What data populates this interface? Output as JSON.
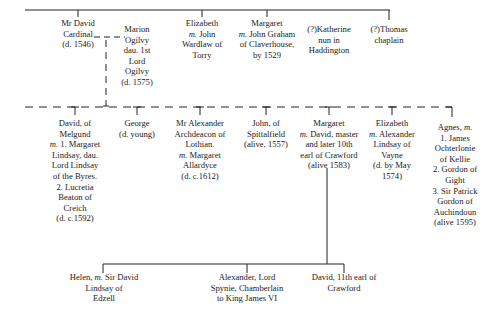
{
  "colors": {
    "line": "#222222",
    "text": "#1a1a1a",
    "background": "#ffffff"
  },
  "generation_1": [
    {
      "id": "david-cardinal",
      "lines": [
        "Mr David",
        "Cardinal",
        "(d. 1546)"
      ],
      "x": 78,
      "y": 18,
      "w": 70
    },
    {
      "id": "marion-ogilvy",
      "lines": [
        "Marion",
        "Ogilvy",
        "dau. 1st",
        "Lord",
        "Ogilvy",
        "(d. 1575)"
      ],
      "x": 137,
      "y": 24,
      "w": 60
    },
    {
      "id": "elizabeth-wardlaw",
      "lines": [
        "Elizabeth",
        "m. John",
        "Wardlaw of",
        "Torry"
      ],
      "x": 202,
      "y": 18,
      "w": 70
    },
    {
      "id": "margaret-graham",
      "lines": [
        "Margaret",
        "m. John Graham",
        "of Claverhouse,",
        "by 1529"
      ],
      "x": 267,
      "y": 18,
      "w": 76
    },
    {
      "id": "katherine",
      "lines": [
        "(?)Katherine",
        "nun in",
        "Haddington"
      ],
      "x": 329,
      "y": 24,
      "w": 66
    },
    {
      "id": "thomas",
      "lines": [
        "(?)Thomas",
        "chaplain"
      ],
      "x": 389,
      "y": 24,
      "w": 60
    }
  ],
  "generation_2": [
    {
      "id": "david-melgund",
      "lines": [
        "David, of",
        "Melgund",
        "m. 1. Margaret",
        "Lindsay, dau.",
        "Lord Lindsay",
        "of the Byres.",
        "2. Lucretia",
        "Beaton of",
        "Creich",
        "(d. c.1592)"
      ],
      "x": 75,
      "y": 118,
      "w": 72
    },
    {
      "id": "george",
      "lines": [
        "George",
        "(d. young)"
      ],
      "x": 137,
      "y": 118,
      "w": 60
    },
    {
      "id": "alexander-archdeacon",
      "lines": [
        "Mr Alexander",
        "Archdeacon of",
        "Lothian.",
        "m. Margaret",
        "Allardyce",
        "(d. c.1612)"
      ],
      "x": 200,
      "y": 118,
      "w": 70
    },
    {
      "id": "john-spittalfield",
      "lines": [
        "John, of",
        "Spittalfield",
        "(alive, 1557)"
      ],
      "x": 266,
      "y": 118,
      "w": 64
    },
    {
      "id": "margaret-crawford",
      "lines": [
        "Margaret",
        "m. David, master",
        "and later 10th",
        "earl of Crawford",
        "(alive 1583)"
      ],
      "x": 329,
      "y": 118,
      "w": 78
    },
    {
      "id": "elizabeth-lindsay",
      "lines": [
        "Elizabeth",
        "m. Alexander",
        "Lindsay of",
        "Vayne",
        "(d. by May",
        "1574)"
      ],
      "x": 392,
      "y": 118,
      "w": 66
    },
    {
      "id": "agnes",
      "lines": [
        "Agnes, m.",
        "1. James",
        "Ochterlonie",
        "of Kellie",
        "2. Gordon of",
        "Gight",
        "3. Sir Patrick",
        "Gordon of",
        "Auchindoun",
        "(alive 1595)"
      ],
      "x": 455,
      "y": 122,
      "w": 64
    }
  ],
  "generation_3": [
    {
      "id": "helen",
      "lines": [
        "Helen, m. Sir David",
        "Lindsay of",
        "Edzell"
      ],
      "x": 104,
      "y": 272,
      "w": 90
    },
    {
      "id": "alexander-spynie",
      "lines": [
        "Alexander, Lord",
        "Spynie, Chamberlain",
        "to King James VI"
      ],
      "x": 247,
      "y": 272,
      "w": 90
    },
    {
      "id": "david-11th-earl",
      "lines": [
        "David, 11th earl of",
        "Crawford"
      ],
      "x": 344,
      "y": 272,
      "w": 90
    }
  ]
}
